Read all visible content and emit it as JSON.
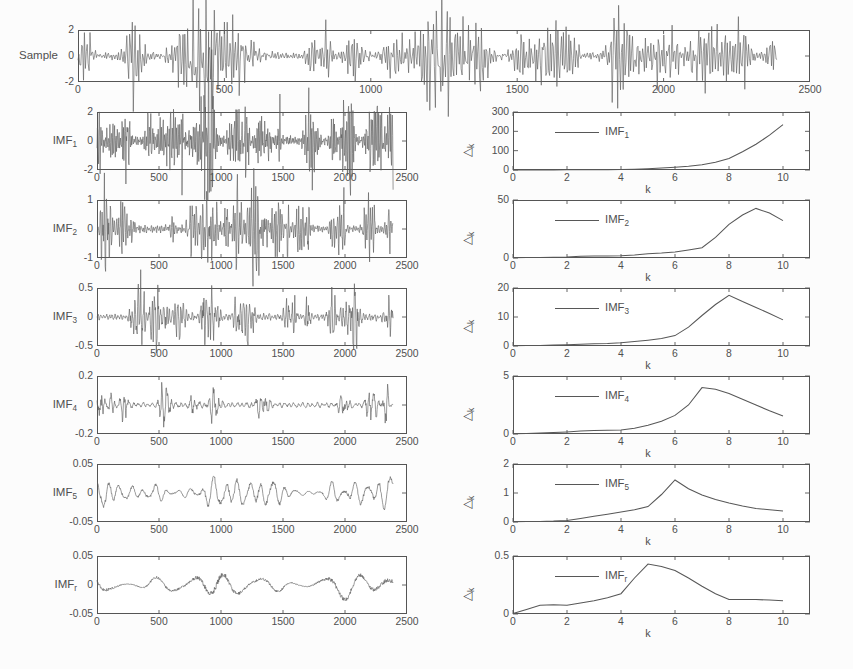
{
  "figure": {
    "sample_label": "Sample",
    "x_axis_label": "k",
    "y_axis_label": "△",
    "y_axis_label_sub": "k"
  },
  "signal_xticks": [
    "0",
    "500",
    "1000",
    "1500",
    "2000",
    "2500"
  ],
  "dk_xticks": [
    "0",
    "2",
    "4",
    "6",
    "8",
    "10"
  ],
  "rows": [
    {
      "label": "IMF",
      "label_sub": "1",
      "signal": {
        "yticks": [
          "2",
          "0",
          "-2"
        ],
        "ylim": [
          -2,
          2
        ],
        "xlim": [
          0,
          2500
        ],
        "amp": 0.95,
        "seed": 11,
        "burst": 34,
        "fine": 3.1
      },
      "dk": {
        "legend": "IMF",
        "legend_sub": "1",
        "yticks": [
          "300",
          "200",
          "100",
          "0"
        ],
        "ylim": [
          0,
          300
        ],
        "xlim": [
          0,
          11
        ],
        "x": [
          0,
          0.5,
          1,
          1.5,
          2,
          2.5,
          3,
          3.5,
          4,
          4.5,
          5,
          5.5,
          6,
          6.5,
          7,
          7.5,
          8,
          8.5,
          9,
          9.5,
          10
        ],
        "y": [
          0.3,
          0.4,
          0.5,
          0.6,
          0.8,
          1.0,
          1.3,
          1.6,
          2.2,
          3.5,
          6,
          10,
          14,
          19,
          27,
          40,
          60,
          94,
          133,
          180,
          235
        ]
      }
    },
    {
      "label": "IMF",
      "label_sub": "2",
      "signal": {
        "yticks": [
          "1",
          "0",
          "-1"
        ],
        "ylim": [
          -1,
          1
        ],
        "xlim": [
          0,
          2500
        ],
        "amp": 0.78,
        "seed": 23,
        "burst": 30,
        "fine": 2.3
      },
      "dk": {
        "legend": "IMF",
        "legend_sub": "2",
        "yticks": [
          "50",
          "0"
        ],
        "ylim": [
          0,
          62
        ],
        "xlim": [
          0,
          11
        ],
        "x": [
          0,
          0.5,
          1,
          1.5,
          2,
          2.5,
          3,
          3.5,
          4,
          4.5,
          5,
          5.5,
          6,
          6.5,
          7,
          7.5,
          8,
          8.5,
          9,
          9.5,
          10
        ],
        "y": [
          0.3,
          0.4,
          0.6,
          0.9,
          1.2,
          1.8,
          2.0,
          2.1,
          2.3,
          3.2,
          4.6,
          5.2,
          6.4,
          8.5,
          11,
          22,
          36,
          46,
          53,
          48,
          40
        ]
      }
    },
    {
      "label": "IMF",
      "label_sub": "3",
      "signal": {
        "yticks": [
          "0.5",
          "0",
          "-0.5"
        ],
        "ylim": [
          -0.5,
          0.5
        ],
        "xlim": [
          0,
          2500
        ],
        "amp": 0.7,
        "seed": 37,
        "burst": 24,
        "fine": 1.65
      },
      "dk": {
        "legend": "IMF",
        "legend_sub": "3",
        "yticks": [
          "20",
          "10",
          "0"
        ],
        "ylim": [
          0,
          20
        ],
        "xlim": [
          0,
          11
        ],
        "x": [
          0,
          0.5,
          1,
          1.5,
          2,
          2.5,
          3,
          3.5,
          4,
          4.5,
          5,
          5.5,
          6,
          6.5,
          7,
          7.5,
          8,
          8.5,
          9,
          9.5,
          10
        ],
        "y": [
          0.1,
          0.15,
          0.2,
          0.3,
          0.4,
          0.6,
          0.8,
          0.9,
          1.1,
          1.5,
          2.0,
          2.6,
          3.6,
          6.5,
          10.5,
          14.3,
          17.5,
          15.3,
          13.3,
          11.2,
          9.0
        ]
      }
    },
    {
      "label": "IMF",
      "label_sub": "4",
      "signal": {
        "yticks": [
          "0.2",
          "0",
          "-0.2"
        ],
        "ylim": [
          -0.2,
          0.2
        ],
        "xlim": [
          0,
          2500
        ],
        "amp": 0.55,
        "seed": 53,
        "burst": 14,
        "fine": 1.0
      },
      "dk": {
        "legend": "IMF",
        "legend_sub": "4",
        "yticks": [
          "5",
          "0"
        ],
        "ylim": [
          0,
          5
        ],
        "xlim": [
          0,
          11
        ],
        "x": [
          0,
          0.5,
          1,
          1.5,
          2,
          2.5,
          3,
          3.5,
          4,
          4.5,
          5,
          5.5,
          6,
          6.5,
          7,
          7.5,
          8,
          8.5,
          9,
          9.5,
          10
        ],
        "y": [
          0.03,
          0.05,
          0.08,
          0.12,
          0.18,
          0.25,
          0.3,
          0.32,
          0.35,
          0.5,
          0.75,
          1.1,
          1.6,
          2.5,
          4.0,
          3.85,
          3.5,
          3.0,
          2.5,
          2.0,
          1.55
        ]
      }
    },
    {
      "label": "IMF",
      "label_sub": "5",
      "signal": {
        "yticks": [
          "0.05",
          "0",
          "-0.05"
        ],
        "ylim": [
          -0.05,
          0.05
        ],
        "xlim": [
          0,
          2500
        ],
        "amp": 0.62,
        "seed": 71,
        "burst": 0,
        "fine": 0.4
      },
      "dk": {
        "legend": "IMF",
        "legend_sub": "5",
        "yticks": [
          "2",
          "1",
          "0"
        ],
        "ylim": [
          0,
          2
        ],
        "xlim": [
          0,
          11
        ],
        "x": [
          0,
          0.5,
          1,
          1.5,
          2,
          2.5,
          3,
          3.5,
          4,
          4.5,
          5,
          5.5,
          6,
          6.5,
          7,
          7.5,
          8,
          8.5,
          9,
          9.5,
          10
        ],
        "y": [
          0.01,
          0.015,
          0.02,
          0.03,
          0.05,
          0.12,
          0.2,
          0.27,
          0.35,
          0.42,
          0.53,
          0.95,
          1.45,
          1.15,
          0.93,
          0.78,
          0.66,
          0.55,
          0.47,
          0.42,
          0.38
        ]
      }
    },
    {
      "label": "IMF",
      "label_sub": "r",
      "signal": {
        "yticks": [
          "0.05",
          "0",
          "-0.05"
        ],
        "ylim": [
          -0.05,
          0.05
        ],
        "xlim": [
          0,
          2500
        ],
        "amp": 0.55,
        "seed": 97,
        "burst": 0,
        "fine": 0.14
      },
      "dk": {
        "legend": "IMF",
        "legend_sub": "r",
        "yticks": [
          "0.5",
          "0"
        ],
        "ylim": [
          0,
          0.5
        ],
        "xlim": [
          0,
          11
        ],
        "x": [
          0,
          0.5,
          1,
          1.5,
          2,
          2.5,
          3,
          3.5,
          4,
          4.5,
          5,
          5.5,
          6,
          6.5,
          7,
          7.5,
          8,
          8.5,
          9,
          9.5,
          10
        ],
        "y": [
          0.005,
          0.04,
          0.075,
          0.08,
          0.075,
          0.095,
          0.115,
          0.14,
          0.175,
          0.31,
          0.43,
          0.41,
          0.375,
          0.31,
          0.24,
          0.175,
          0.125,
          0.125,
          0.125,
          0.12,
          0.115
        ]
      }
    }
  ],
  "sample": {
    "yticks": [
      "2",
      "0",
      "-2"
    ],
    "ylim": [
      -2,
      2
    ],
    "xlim": [
      0,
      2500
    ],
    "amp": 0.95,
    "seed": 5,
    "burst": 40,
    "fine": 4.2
  }
}
